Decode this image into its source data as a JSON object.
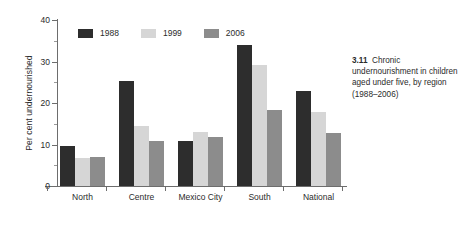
{
  "chart_data": {
    "type": "bar",
    "title": "",
    "xlabel": "",
    "ylabel": "Per cent undernourished",
    "ylim": [
      0,
      40
    ],
    "yticks": [
      0,
      10,
      20,
      30,
      40
    ],
    "ytick_labels": [
      "0",
      "10",
      "20",
      "30",
      "40"
    ],
    "yminor_ticks": [
      5,
      15,
      25,
      35
    ],
    "grid": false,
    "legend_position": "top-left-inside",
    "categories": [
      "North",
      "Centre",
      "Mexico City",
      "South",
      "National"
    ],
    "series": [
      {
        "name": "1988",
        "color": "#2d2d2d",
        "values": [
          9.7,
          25.2,
          10.8,
          34.0,
          23.0
        ]
      },
      {
        "name": "1999",
        "color": "#d6d6d6",
        "values": [
          6.8,
          14.5,
          12.9,
          29.2,
          17.8
        ]
      },
      {
        "name": "2006",
        "color": "#8c8c8c",
        "values": [
          7.0,
          10.8,
          11.9,
          18.3,
          12.7
        ]
      }
    ]
  },
  "caption": {
    "number": "3.11",
    "text": "Chronic undernourishment in children aged under five, by region (1988–2006)"
  }
}
